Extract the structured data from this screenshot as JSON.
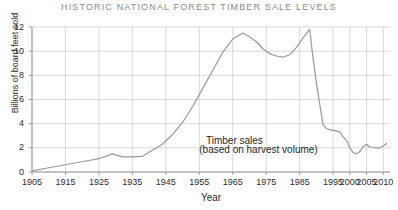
{
  "chart_data": {
    "type": "line",
    "title": "HISTORIC NATIONAL FOREST TIMBER SALE LEVELS",
    "xlabel": "Year",
    "ylabel": "Billions of board feet sold",
    "xlim": [
      1905,
      2012
    ],
    "ylim": [
      0,
      12
    ],
    "grid": true,
    "legend": "none",
    "ytick_labels": [
      "0",
      "2",
      "4",
      "6",
      "8",
      "10",
      "12"
    ],
    "ytick_values": [
      0,
      2,
      4,
      6,
      8,
      10,
      12
    ],
    "xtick_labels": [
      "1905",
      "1915",
      "1925",
      "1935",
      "1945",
      "1955",
      "1965",
      "1975",
      "1985",
      "1995",
      "2000",
      "2005",
      "2010"
    ],
    "xtick_values": [
      1905,
      1915,
      1925,
      1935,
      1945,
      1955,
      1965,
      1975,
      1985,
      1995,
      2000,
      2005,
      2010
    ],
    "annotations": [
      {
        "text": "Timber sales",
        "x": 1957,
        "y": 2.6
      },
      {
        "text": "(based on harvest volume)",
        "x": 1955,
        "y": 1.85
      }
    ],
    "series": [
      {
        "name": "Timber sales (based on harvest volume)",
        "color": "#999999",
        "x": [
          1905,
          1910,
          1915,
          1920,
          1925,
          1929,
          1932,
          1935,
          1938,
          1941,
          1944,
          1947,
          1950,
          1953,
          1956,
          1959,
          1962,
          1965,
          1968,
          1970,
          1972,
          1974,
          1976,
          1978,
          1980,
          1982,
          1984,
          1986,
          1988,
          1989,
          1990,
          1991,
          1992,
          1993,
          1994,
          1995,
          1996,
          1997,
          1998,
          1999,
          2000,
          2001,
          2002,
          2003,
          2004,
          2005,
          2006,
          2007,
          2008,
          2009,
          2010,
          2011
        ],
        "values": [
          0.1,
          0.35,
          0.6,
          0.85,
          1.1,
          1.5,
          1.25,
          1.25,
          1.3,
          1.8,
          2.3,
          3.1,
          4.1,
          5.4,
          6.9,
          8.4,
          9.9,
          11.0,
          11.5,
          11.2,
          10.8,
          10.2,
          9.8,
          9.6,
          9.5,
          9.7,
          10.3,
          11.1,
          11.8,
          9.4,
          7.4,
          5.6,
          3.9,
          3.6,
          3.5,
          3.45,
          3.4,
          3.3,
          2.9,
          2.6,
          2.0,
          1.6,
          1.5,
          1.7,
          2.1,
          2.3,
          2.05,
          2.05,
          2.0,
          2.0,
          2.15,
          2.35
        ]
      }
    ]
  },
  "axis": {
    "y_title": "Billions of board feet sold",
    "x_title": "Year"
  }
}
